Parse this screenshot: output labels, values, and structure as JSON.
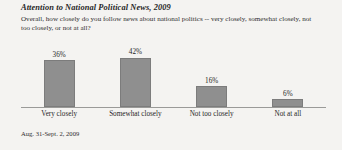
{
  "chart_data": {
    "type": "bar",
    "title": "Attention to National Political News, 2009",
    "subtitle": "Overall, how closely do you follow news about national politics -- very closely, somewhat closely, not too closely, or not at all?",
    "categories": [
      "Very closely",
      "Somewhat closely",
      "Not too closely",
      "Not at all"
    ],
    "values": [
      36,
      42,
      16,
      6
    ],
    "value_labels": [
      "36%",
      "42%",
      "16%",
      "6%"
    ],
    "xlabel": "",
    "ylabel": "",
    "ylim": [
      0,
      45
    ],
    "grid": false,
    "legend": null,
    "axis_visible": "x-baseline-only",
    "footnote": "Aug. 31-Sept. 2, 2009",
    "bar_color": "#8f8f8f",
    "bar_border_color": "#7c7c7c",
    "background_color": "#f4f3f1",
    "text_color": "#262626"
  }
}
